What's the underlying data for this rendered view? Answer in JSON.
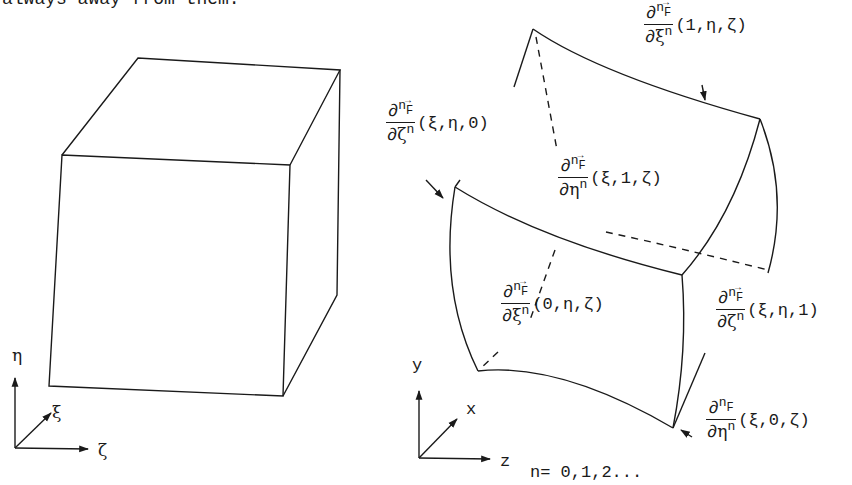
{
  "header_fragment": "always away from them.",
  "left_figure": {
    "name": "unit cube in computational space",
    "axes": {
      "up": "η",
      "diag": "ξ",
      "right": "ζ"
    }
  },
  "right_figure": {
    "name": "curvilinear hexahedron in physical space",
    "axes": {
      "up": "y",
      "diag": "x",
      "right": "z"
    },
    "labels": [
      {
        "id": "xi1",
        "num_op": "∂",
        "num_exp": "n",
        "func": "F",
        "den_var": "ξ",
        "den_exp": "n",
        "args": "(1,η,ζ)"
      },
      {
        "id": "zeta0",
        "num_op": "∂",
        "num_exp": "n",
        "func": "F",
        "den_var": "ζ",
        "den_exp": "n",
        "args": "(ξ,η,0)"
      },
      {
        "id": "eta1",
        "num_op": "∂",
        "num_exp": "n",
        "func": "F",
        "den_var": "η",
        "den_exp": "n",
        "args": "(ξ,1,ζ)"
      },
      {
        "id": "xi0",
        "num_op": "∂",
        "num_exp": "n",
        "func": "F",
        "den_var": "ξ",
        "den_exp": "n",
        "args": "(0,η,ζ)"
      },
      {
        "id": "zeta1",
        "num_op": "∂",
        "num_exp": "n",
        "func": "F",
        "den_var": "ζ",
        "den_exp": "n",
        "args": "(ξ,η,1)"
      },
      {
        "id": "eta0",
        "num_op": "∂",
        "num_exp": "n",
        "func": "F",
        "den_var": "η",
        "den_exp": "n",
        "args": "(ξ,0,ζ)"
      }
    ],
    "vector_arrow": "→",
    "n_values": "n= 0,1,2..."
  }
}
